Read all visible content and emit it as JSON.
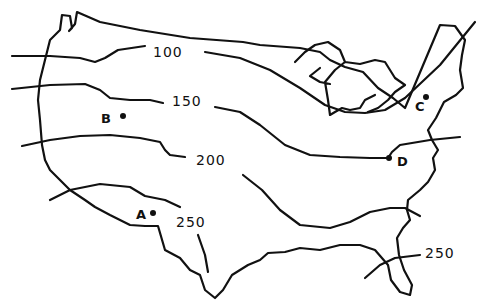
{
  "map": {
    "subject": "Contiguous United States outline with isolines",
    "line_color": "#111111",
    "background": "#ffffff",
    "isolines": [
      {
        "value": "100",
        "label": "100"
      },
      {
        "value": "150",
        "label": "150"
      },
      {
        "value": "200",
        "label": "200"
      },
      {
        "value": "250",
        "label": "250",
        "note": "southwest"
      },
      {
        "value": "250",
        "label": "250",
        "note": "southeast / Florida"
      }
    ],
    "points": [
      {
        "id": "A",
        "label": "A"
      },
      {
        "id": "B",
        "label": "B"
      },
      {
        "id": "C",
        "label": "C"
      },
      {
        "id": "D",
        "label": "D"
      }
    ]
  }
}
